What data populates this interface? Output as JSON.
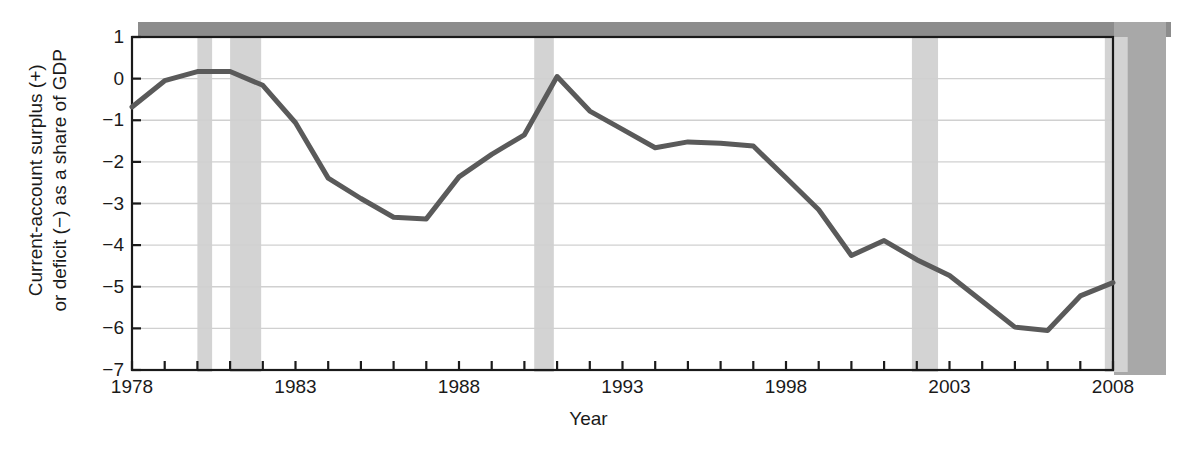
{
  "chart_data": {
    "type": "line",
    "title": "",
    "xlabel": "Year",
    "ylabel": "Current-account surplus (+) or deficit (−) as a share of GDP",
    "ylabel_line1": "Current-account surplus (+)",
    "ylabel_line2": "or deficit (−) as a share of GDP",
    "xlim": [
      1978,
      2008
    ],
    "ylim": [
      -7,
      1
    ],
    "yticks": [
      1,
      0,
      -1,
      -2,
      -3,
      -4,
      -5,
      -6,
      -7
    ],
    "ytick_labels": [
      "1",
      "0",
      "−1",
      "−2",
      "−3",
      "−4",
      "−5",
      "−6",
      "−7"
    ],
    "xticks": [
      1978,
      1983,
      1988,
      1993,
      1998,
      2003,
      2008
    ],
    "xtick_labels": [
      "1978",
      "1983",
      "1988",
      "1993",
      "1998",
      "2003",
      "2008"
    ],
    "x_minor_tick_interval": 1,
    "grid": "horizontal",
    "legend": "none",
    "line_color": "#5a5a5a",
    "line_width": 5,
    "grid_color": "#d0d0d0",
    "axis_color": "#1a1a1a",
    "shade_color": "#d3d3d3",
    "x": [
      1978,
      1979,
      1980,
      1981,
      1982,
      1983,
      1984,
      1985,
      1986,
      1987,
      1988,
      1989,
      1990,
      1991,
      1992,
      1993,
      1994,
      1995,
      1996,
      1997,
      1998,
      1999,
      2000,
      2001,
      2002,
      2003,
      2004,
      2005,
      2006,
      2007,
      2008
    ],
    "values": [
      -0.68,
      -0.05,
      0.17,
      0.17,
      -0.16,
      -1.06,
      -2.39,
      -2.88,
      -3.33,
      -3.37,
      -2.36,
      -1.82,
      -1.35,
      0.05,
      -0.78,
      -1.22,
      -1.66,
      -1.52,
      -1.55,
      -1.62,
      -2.38,
      -3.15,
      -4.25,
      -3.89,
      -4.35,
      -4.73,
      -5.35,
      -5.97,
      -6.05,
      -5.22,
      -4.9
    ],
    "series": [
      {
        "name": "Current-account balance as a share of GDP",
        "values": [
          -0.68,
          -0.05,
          0.17,
          0.17,
          -0.16,
          -1.06,
          -2.39,
          -2.88,
          -3.33,
          -3.37,
          -2.36,
          -1.82,
          -1.35,
          0.05,
          -0.78,
          -1.22,
          -1.66,
          -1.52,
          -1.55,
          -1.62,
          -2.38,
          -3.15,
          -4.25,
          -3.89,
          -4.35,
          -4.73,
          -5.35,
          -5.97,
          -6.05,
          -5.22,
          -4.9
        ]
      }
    ],
    "shaded_regions": [
      {
        "label": "recession-1980",
        "start": 1980.0,
        "end": 1980.45
      },
      {
        "label": "recession-1981-1982",
        "start": 1981.0,
        "end": 1981.95
      },
      {
        "label": "recession-1990-1991",
        "start": 1990.3,
        "end": 1990.9
      },
      {
        "label": "recession-2001",
        "start": 1990.3,
        "end": 1990.9,
        "start_x": 2001.85,
        "end_x": 2002.65
      },
      {
        "label": "recession-2007-2008",
        "start": 2007.75,
        "end": 2008.45
      }
    ],
    "annotations": []
  }
}
